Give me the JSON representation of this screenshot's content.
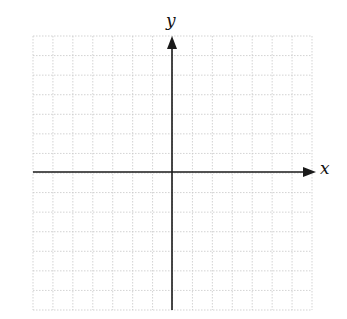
{
  "diagram": {
    "type": "coordinate-plane",
    "axes": {
      "x_label": "x",
      "y_label": "y"
    },
    "grid": {
      "columns": 14,
      "rows": 14,
      "style": "dotted",
      "color": "#c8c8c8"
    },
    "colors": {
      "axis": "#1a1a1a",
      "background": "#ffffff"
    }
  }
}
